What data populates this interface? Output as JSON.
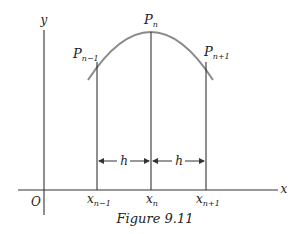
{
  "figure": {
    "caption": "Figure 9.11",
    "axes": {
      "x_label": "x",
      "y_label": "y",
      "origin_label": "O"
    },
    "points": [
      {
        "name": "P",
        "sub": "n−1"
      },
      {
        "name": "P",
        "sub": "n"
      },
      {
        "name": "P",
        "sub": "n+1"
      }
    ],
    "x_ticks": [
      {
        "name": "x",
        "sub": "n−1"
      },
      {
        "name": "x",
        "sub": "n"
      },
      {
        "name": "x",
        "sub": "n+1"
      }
    ],
    "spacing_labels": [
      "h",
      "h"
    ],
    "colors": {
      "curve": "#8a8a8a",
      "lines": "#333333"
    }
  }
}
